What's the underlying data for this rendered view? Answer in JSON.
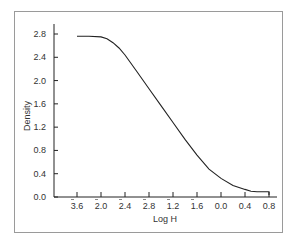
{
  "chart_data": {
    "type": "line",
    "title": "",
    "xlabel": "Log H",
    "ylabel": "Density",
    "x_ticks": [
      {
        "label": "3.6",
        "bar": true
      },
      {
        "label": "2.0",
        "bar": true
      },
      {
        "label": "2.4",
        "bar": true
      },
      {
        "label": "2.8",
        "bar": true
      },
      {
        "label": "1.2",
        "bar": true
      },
      {
        "label": "1.6",
        "bar": true
      },
      {
        "label": "0.0",
        "bar": false
      },
      {
        "label": "0.4",
        "bar": false
      },
      {
        "label": "0.8",
        "bar": false
      }
    ],
    "x_ticks_numeric": [
      -2.4,
      -2.0,
      -1.6,
      -1.2,
      -0.8,
      -0.4,
      0.0,
      0.4,
      0.8
    ],
    "y_ticks": [
      "0.0",
      "0.4",
      "0.8",
      "1.2",
      "1.6",
      "2.0",
      "2.4",
      "2.8"
    ],
    "ylim": [
      0,
      2.8
    ],
    "xlim": [
      -2.4,
      0.8
    ],
    "grid": false,
    "legend": null,
    "series": [
      {
        "name": "Characteristic curve",
        "x": [
          -2.4,
          -2.2,
          -2.0,
          -1.9,
          -1.8,
          -1.7,
          -1.6,
          -1.4,
          -1.2,
          -1.0,
          -0.8,
          -0.6,
          -0.4,
          -0.2,
          0.0,
          0.2,
          0.4,
          0.5,
          0.6,
          0.7,
          0.8
        ],
        "values": [
          2.76,
          2.76,
          2.75,
          2.72,
          2.65,
          2.56,
          2.44,
          2.15,
          1.86,
          1.57,
          1.28,
          0.99,
          0.72,
          0.48,
          0.32,
          0.2,
          0.13,
          0.1,
          0.09,
          0.09,
          0.09
        ]
      }
    ]
  }
}
